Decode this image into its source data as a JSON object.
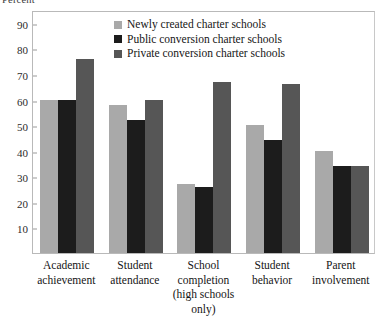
{
  "chart_data": {
    "type": "bar",
    "title": "",
    "xlabel": "",
    "ylabel": "Percent",
    "ylim": [
      0,
      95
    ],
    "yticks": [
      10,
      20,
      30,
      40,
      50,
      60,
      70,
      80,
      90
    ],
    "grid": false,
    "legend_position": "top-center",
    "categories": [
      "Academic achievement",
      "Student attendance",
      "School completion (high schools only)",
      "Student behavior",
      "Parent involvement"
    ],
    "category_lines": [
      [
        "Academic",
        "achievement"
      ],
      [
        "Student",
        "attendance"
      ],
      [
        "School",
        "completion",
        "(high schools",
        "only)"
      ],
      [
        "Student",
        "behavior"
      ],
      [
        "Parent",
        "involvement"
      ]
    ],
    "series": [
      {
        "name": "Newly created charter schools",
        "color": "#a9a9a9",
        "values": [
          60,
          58,
          27,
          50,
          40
        ]
      },
      {
        "name": "Public conversion charter schools",
        "color": "#1c1c1c",
        "values": [
          60,
          52,
          26,
          44,
          34
        ]
      },
      {
        "name": "Private conversion charter schools",
        "color": "#565656",
        "values": [
          76,
          60,
          67,
          66,
          34
        ]
      }
    ]
  },
  "axis": {
    "y_title": "Percent"
  },
  "legend": {
    "entries": [
      "Newly created charter schools",
      "Public conversion charter schools",
      "Private conversion charter schools"
    ]
  }
}
